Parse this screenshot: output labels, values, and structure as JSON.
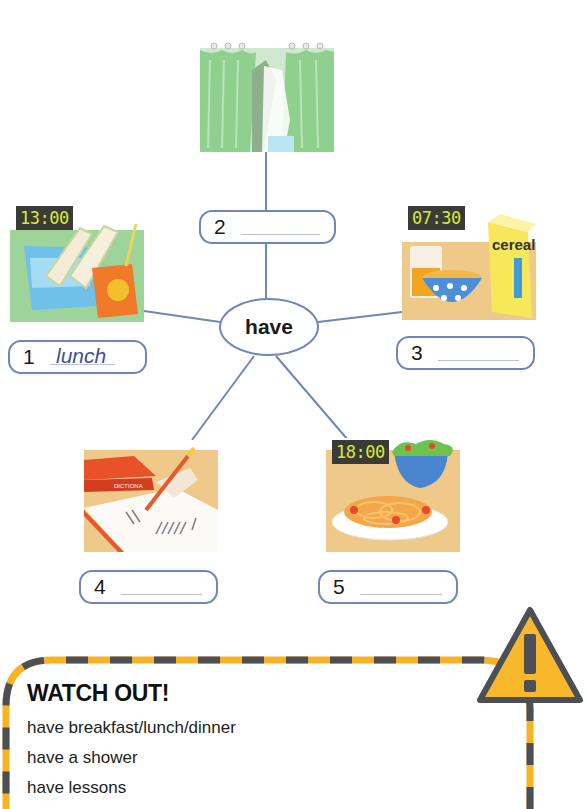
{
  "mindmap": {
    "center_word": "have",
    "items": [
      {
        "number": "1",
        "answer": "lunch",
        "clock": "13:00",
        "picture": "lunchbox-sandwich-juice"
      },
      {
        "number": "2",
        "answer": "",
        "clock": "",
        "picture": "shower-curtain"
      },
      {
        "number": "3",
        "answer": "",
        "clock": "07:30",
        "picture": "cereal-breakfast"
      },
      {
        "number": "4",
        "answer": "",
        "clock": "",
        "picture": "writing-lesson-dictionary"
      },
      {
        "number": "5",
        "answer": "",
        "clock": "18:00",
        "picture": "spaghetti-salad-dinner"
      }
    ],
    "cereal_box_label": "cereal",
    "dictionary_label": "DICTIONA"
  },
  "watch_out": {
    "title": "WATCH OUT!",
    "lines": [
      "have breakfast/lunch/dinner",
      "have a shower",
      "have lessons"
    ]
  },
  "colors": {
    "line": "#7186b8",
    "clock_bg": "#3a3a36",
    "clock_digits": "#d7ec33",
    "stripe_yellow": "#f5b325",
    "stripe_grey": "#4d4f57"
  }
}
